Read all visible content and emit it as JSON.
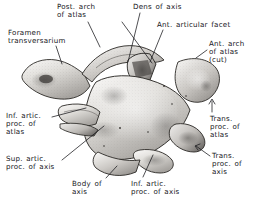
{
  "figure": {
    "view": "posterosuperior oblique",
    "background_color": "#ffffff",
    "ink_color": "#16161a",
    "bone_tone_light": "#f2f1ef",
    "bone_tone_mid": "#b9b7b4",
    "bone_tone_dark": "#4a4845",
    "style": "grayscale stipple and wash anatomical drawing with handwritten leader labels"
  },
  "labels": [
    {
      "id": "post-arch-of-atlas",
      "lines": [
        "Post. arch",
        "of atlas"
      ],
      "x": 57,
      "y": 3,
      "align": "left"
    },
    {
      "id": "dens-of-axis",
      "lines": [
        "Dens of axis"
      ],
      "x": 133,
      "y": 3,
      "align": "left"
    },
    {
      "id": "ant-articular-facet",
      "lines": [
        "Ant. articular facet"
      ],
      "x": 157,
      "y": 21,
      "align": "left"
    },
    {
      "id": "foramen-transversarium",
      "lines": [
        "Foramen",
        "transversarium"
      ],
      "x": 8,
      "y": 29,
      "align": "left"
    },
    {
      "id": "ant-arch-of-atlas",
      "lines": [
        "Ant. arch",
        "of atlas",
        "(cut)"
      ],
      "x": 209,
      "y": 40,
      "align": "left"
    },
    {
      "id": "inf-artic-proc-of-atlas",
      "lines": [
        "Inf. artic.",
        "proc. of",
        "atlas"
      ],
      "x": 6,
      "y": 112,
      "align": "left"
    },
    {
      "id": "trans-proc-of-atlas",
      "lines": [
        "Trans.",
        "proc. of",
        "atlas"
      ],
      "x": 210,
      "y": 115,
      "align": "left"
    },
    {
      "id": "trans-proc-of-axis",
      "lines": [
        "Trans.",
        "proc. of",
        "axis"
      ],
      "x": 212,
      "y": 152,
      "align": "left"
    },
    {
      "id": "sup-artic-proc-of-axis",
      "lines": [
        "Sup. artic.",
        "proc. of axis"
      ],
      "x": 6,
      "y": 155,
      "align": "left"
    },
    {
      "id": "body-of-axis",
      "lines": [
        "Body of",
        "axis"
      ],
      "x": 72,
      "y": 180,
      "align": "left"
    },
    {
      "id": "inf-artic-proc-of-axis",
      "lines": [
        "Inf. artic.",
        "proc. of axis"
      ],
      "x": 131,
      "y": 180,
      "align": "left"
    }
  ],
  "leaders": [
    {
      "id": "leader-post-arch-of-atlas",
      "path": "M 88,22 L 100,47"
    },
    {
      "id": "leader-post-arch-of-atlas-2",
      "path": "M 122,22 L 152,63"
    },
    {
      "id": "leader-dens-of-axis",
      "path": "M 140,13 L 128,62"
    },
    {
      "id": "leader-ant-articular-facet",
      "path": "M 163,30 L 150,62"
    },
    {
      "id": "leader-foramen-transversarium",
      "path": "M 56,46 L 62,64"
    },
    {
      "id": "leader-ant-arch-of-atlas",
      "path": "M 207,50 L 196,58"
    },
    {
      "id": "leader-inf-artic-proc-of-atlas",
      "path": "M 52,117 L 86,108"
    },
    {
      "id": "leader-trans-proc-of-atlas",
      "path": "M 212,112 L 212,101"
    },
    {
      "id": "leader-trans-proc-of-axis",
      "path": "M 210,156 L 196,146"
    },
    {
      "id": "leader-sup-artic-proc-of-axis",
      "path": "M 62,160 L 104,126"
    },
    {
      "id": "leader-body-of-axis",
      "path": "M 106,178 L 117,166"
    },
    {
      "id": "leader-inf-artic-proc-of-axis",
      "path": "M 143,177 L 153,155"
    }
  ]
}
